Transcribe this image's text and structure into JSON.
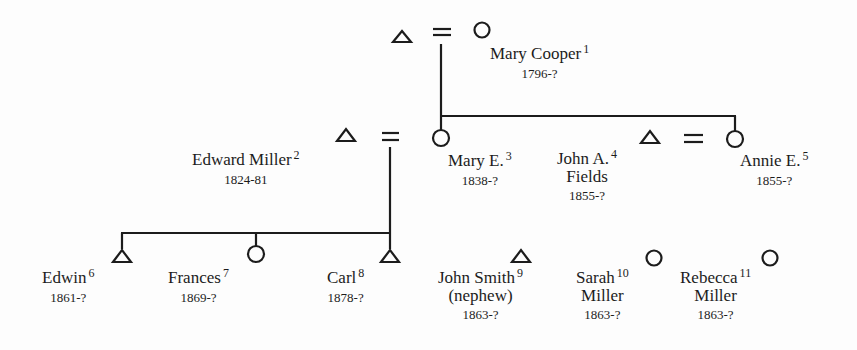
{
  "diagram": {
    "type": "kinship-chart",
    "symbols": {
      "male": "triangle-icon",
      "female": "circle-icon",
      "marriage": "equals-sign"
    },
    "people": [
      {
        "id": 1,
        "name": "Mary Cooper",
        "line2": "",
        "years": "1796-?",
        "sex": "female",
        "ref": "1"
      },
      {
        "id": 2,
        "name": "Edward Miller",
        "line2": "",
        "years": "1824-81",
        "sex": "male",
        "ref": "2"
      },
      {
        "id": 3,
        "name": "Mary E.",
        "line2": "",
        "years": "1838-?",
        "sex": "female",
        "ref": "3"
      },
      {
        "id": 4,
        "name": "John A.",
        "line2": "Fields",
        "years": "1855-?",
        "sex": "male",
        "ref": "4"
      },
      {
        "id": 5,
        "name": "Annie E.",
        "line2": "",
        "years": "1855-?",
        "sex": "female",
        "ref": "5"
      },
      {
        "id": 6,
        "name": "Edwin",
        "line2": "",
        "years": "1861-?",
        "sex": "male",
        "ref": "6"
      },
      {
        "id": 7,
        "name": "Frances",
        "line2": "",
        "years": "1869-?",
        "sex": "female",
        "ref": "7"
      },
      {
        "id": 8,
        "name": "Carl",
        "line2": "",
        "years": "1878-?",
        "sex": "male",
        "ref": "8"
      },
      {
        "id": 9,
        "name": "John Smith",
        "line2": "(nephew)",
        "years": "1863-?",
        "sex": "male",
        "ref": "9"
      },
      {
        "id": 10,
        "name": "Sarah",
        "line2": "Miller",
        "years": "1863-?",
        "sex": "female",
        "ref": "10"
      },
      {
        "id": 11,
        "name": "Rebecca",
        "line2": "Miller",
        "years": "1863-?",
        "sex": "female",
        "ref": "11"
      }
    ],
    "unmarked_people": [
      {
        "sex": "male",
        "note": "unnamed husband of Mary Cooper"
      }
    ],
    "marriages": [
      {
        "husband": "unnamed",
        "wife": 1
      },
      {
        "husband": 2,
        "wife": 3
      },
      {
        "husband": 4,
        "wife": 5
      }
    ],
    "descent": [
      {
        "parents": "unnamed+1",
        "children": [
          3,
          5
        ]
      },
      {
        "parents": "2+3",
        "children": [
          6,
          7,
          8
        ]
      }
    ],
    "colors": {
      "ink": "#1c1c1c",
      "paper": "#fdfdfd"
    }
  }
}
